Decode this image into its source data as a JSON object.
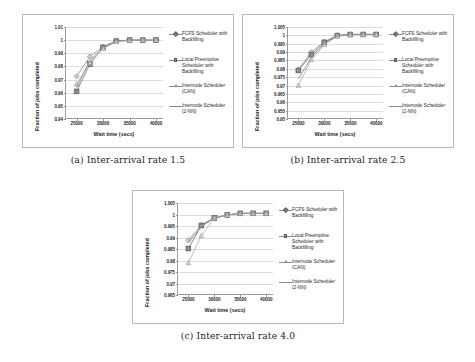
{
  "figure": {
    "panels": [
      {
        "id": "panel-a",
        "caption": "(a) Inter-arrival rate 1.5",
        "chart_data": {
          "type": "line",
          "title": "",
          "xlabel": "Wait time (secs)",
          "ylabel": "Fraction of jobs completed",
          "xlim": [
            23000,
            41500
          ],
          "ylim": [
            0.94,
            1.01
          ],
          "yticks": [
            "0.94",
            "0.95",
            "0.96",
            "0.97",
            "0.98",
            "0.99",
            "1",
            "1.01"
          ],
          "ytick_values": [
            0.94,
            0.95,
            0.96,
            0.97,
            0.98,
            0.99,
            1.0,
            1.01
          ],
          "xticks": [
            "25000",
            "30000",
            "35000",
            "40000"
          ],
          "xtick_values": [
            25000,
            30000,
            35000,
            40000
          ],
          "grid": true,
          "legend_position": "right",
          "x": [
            25000,
            27500,
            30000,
            32500,
            35000,
            37500,
            40000
          ],
          "series": [
            {
              "name": "FCFS Scheduler with Backfilling",
              "marker": "diamond",
              "color": "#9b9b9b",
              "values": [
                0.9725,
                0.9875,
                0.995,
                0.9995,
                1.0,
                1.0,
                1.0
              ]
            },
            {
              "name": "Local Preemptive Scheduler with Backfilling",
              "marker": "square",
              "color": "#7a7a7a",
              "values": [
                0.961,
                0.9818,
                0.9945,
                0.9992,
                1.0,
                1.0,
                1.0
              ]
            },
            {
              "name": "Internode Scheduler (CAN)",
              "marker": "triangle",
              "color": "#b5b5b5",
              "values": [
                0.9665,
                0.983,
                0.9935,
                0.9988,
                0.9998,
                1.0,
                1.0
              ]
            },
            {
              "name": "Internode Scheduler (2-NN)",
              "marker": "line",
              "color": "#8e8e8e",
              "values": [
                0.9638,
                0.9845,
                0.9942,
                0.9992,
                1.0,
                1.0,
                1.0
              ]
            }
          ]
        }
      },
      {
        "id": "panel-b",
        "caption": "(b) Inter-arrival rate 2.5",
        "chart_data": {
          "type": "line",
          "title": "",
          "xlabel": "Wait time (secs)",
          "ylabel": "Fraction of jobs completed",
          "xlim": [
            23000,
            41500
          ],
          "ylim": [
            0.95,
            1.005
          ],
          "yticks": [
            "0.95",
            "0.955",
            "0.96",
            "0.965",
            "0.97",
            "0.975",
            "0.98",
            "0.985",
            "0.99",
            "0.995",
            "1",
            "1.005"
          ],
          "ytick_values": [
            0.95,
            0.955,
            0.96,
            0.965,
            0.97,
            0.975,
            0.98,
            0.985,
            0.99,
            0.995,
            1.0,
            1.005
          ],
          "xticks": [
            "25000",
            "30000",
            "35000",
            "40000"
          ],
          "xtick_values": [
            25000,
            30000,
            35000,
            40000
          ],
          "grid": true,
          "legend_position": "right",
          "x": [
            25000,
            27500,
            30000,
            32500,
            35000,
            37500,
            40000
          ],
          "series": [
            {
              "name": "FCFS Scheduler with Backfilling",
              "marker": "diamond",
              "color": "#9b9b9b",
              "values": [
                0.9795,
                0.99,
                0.9962,
                0.9999,
                1.0007,
                1.0007,
                1.0007
              ]
            },
            {
              "name": "Local Preemptive Scheduler with Backfilling",
              "marker": "square",
              "color": "#7a7a7a",
              "values": [
                0.979,
                0.9885,
                0.9958,
                0.9999,
                1.0005,
                1.0005,
                1.0005
              ]
            },
            {
              "name": "Internode Scheduler (CAN)",
              "marker": "triangle",
              "color": "#b5b5b5",
              "values": [
                0.97,
                0.9855,
                0.9945,
                0.9995,
                1.0004,
                1.0005,
                1.0005
              ]
            },
            {
              "name": "Internode Scheduler (2-NN)",
              "marker": "line",
              "color": "#8e8e8e",
              "values": [
                0.974,
                0.9868,
                0.995,
                0.9996,
                1.0005,
                1.0005,
                1.0005
              ]
            }
          ]
        }
      },
      {
        "id": "panel-c",
        "caption": "(c) Inter-arrival rate 4.0",
        "chart_data": {
          "type": "line",
          "title": "",
          "xlabel": "Wait time (secs)",
          "ylabel": "Fraction of jobs completed",
          "xlim": [
            23000,
            41500
          ],
          "ylim": [
            0.965,
            1.005
          ],
          "yticks": [
            "0.965",
            "0.97",
            "0.975",
            "0.98",
            "0.985",
            "0.99",
            "0.995",
            "1",
            "1.005"
          ],
          "ytick_values": [
            0.965,
            0.97,
            0.975,
            0.98,
            0.985,
            0.99,
            0.995,
            1.0,
            1.005
          ],
          "xticks": [
            "25000",
            "30000",
            "35000",
            "40000"
          ],
          "xtick_values": [
            25000,
            30000,
            35000,
            40000
          ],
          "grid": true,
          "legend_position": "right",
          "x": [
            25000,
            27500,
            30000,
            32500,
            35000,
            37500,
            40000
          ],
          "series": [
            {
              "name": "FCFS Scheduler with Backfilling",
              "marker": "diamond",
              "color": "#9b9b9b",
              "values": [
                0.9888,
                0.9955,
                0.9985,
                0.9998,
                1.0005,
                1.0005,
                1.0005
              ]
            },
            {
              "name": "Local Preemptive Scheduler with Backfilling",
              "marker": "square",
              "color": "#7a7a7a",
              "values": [
                0.9852,
                0.9952,
                0.9985,
                0.9998,
                1.0005,
                1.0005,
                1.0005
              ]
            },
            {
              "name": "Internode Scheduler (CAN)",
              "marker": "triangle",
              "color": "#b5b5b5",
              "values": [
                0.979,
                0.9908,
                0.9985,
                0.9998,
                1.0005,
                1.0005,
                1.0005
              ]
            },
            {
              "name": "Internode Scheduler (2-NN)",
              "marker": "line",
              "color": "#8e8e8e",
              "values": [
                0.9878,
                0.9948,
                0.9984,
                0.9998,
                1.0005,
                1.0005,
                1.0005
              ]
            }
          ]
        }
      }
    ]
  }
}
